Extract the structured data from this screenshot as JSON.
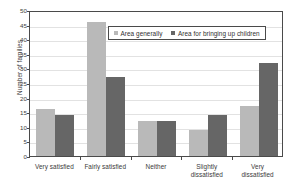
{
  "chart_data": {
    "type": "bar",
    "title": "",
    "xlabel": "",
    "ylabel": "Number of families",
    "ylim": [
      0,
      50
    ],
    "yticks": [
      0,
      5,
      10,
      15,
      20,
      25,
      30,
      35,
      40,
      45,
      50
    ],
    "grid": true,
    "legend_position": "upper-center",
    "categories": [
      "Very satisfied",
      "Fairly satisfied",
      "Neither",
      "Slightly dissatisfied",
      "Very dissatisfied"
    ],
    "category_lines": [
      [
        "Very satisfied"
      ],
      [
        "Fairly satisfied"
      ],
      [
        "Neither"
      ],
      [
        "Slightly",
        "dissatisfied"
      ],
      [
        "Very",
        "dissatisfied"
      ]
    ],
    "series": [
      {
        "name": "Area generally",
        "color": "#b9b9b9",
        "values": [
          16,
          46,
          12,
          9,
          17
        ]
      },
      {
        "name": "Area for bringing up children",
        "color": "#666666",
        "values": [
          14,
          27,
          12,
          14,
          32
        ]
      }
    ]
  }
}
